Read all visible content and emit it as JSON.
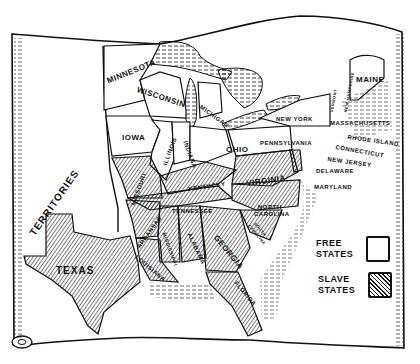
{
  "map": {
    "type": "historical-illustrated-map",
    "subject": "Free and slave states of the United States (pre-Civil War)",
    "colors": {
      "ink": "#111111",
      "paper": "#ffffff"
    },
    "labels": {
      "territories": "TERRITORIES",
      "minnesota": "MINNESOTA",
      "wisconsin": "WISCONSIN",
      "michigan": "MICHIGAN",
      "iowa": "IOWA",
      "illinois": "ILLINOIS",
      "indiana": "INDIANA",
      "ohio": "OHIO",
      "new_york": "NEW YORK",
      "pennsylvania": "PENNSYLVANIA",
      "vermont": "VERMONT",
      "new_hampshire": "NEW HAMPSHIRE",
      "maine": "MAINE",
      "massachusetts": "MASSACHUSETTS",
      "rhode_island": "RHODE ISLAND",
      "connecticut": "CONNECTICUT",
      "new_jersey": "NEW JERSEY",
      "delaware": "DELAWARE",
      "maryland": "MARYLAND",
      "missouri": "MISSOURI",
      "kentucky": "KENTUCKY",
      "virginia": "VIRGINIA",
      "tennessee": "TENNESSEE",
      "north_carolina_1": "NORTH",
      "north_carolina_2": "CAROLINA",
      "south_carolina_1": "SOUTH",
      "south_carolina_2": "CAROLINA",
      "arkansas": "ARKANSAS",
      "mississippi": "MISSISSIPPI",
      "alabama": "ALABAMA",
      "georgia": "GEORGIA",
      "louisiana": "LOUISIANA",
      "texas": "TEXAS",
      "florida": "FLORIDA"
    },
    "free_states": [
      "Minnesota",
      "Wisconsin",
      "Michigan",
      "Iowa",
      "Illinois",
      "Indiana",
      "Ohio",
      "New York",
      "Pennsylvania",
      "Vermont",
      "New Hampshire",
      "Maine",
      "Massachusetts",
      "Rhode Island",
      "Connecticut",
      "New Jersey"
    ],
    "slave_states": [
      "Missouri",
      "Kentucky",
      "Virginia",
      "Tennessee",
      "North Carolina",
      "South Carolina",
      "Arkansas",
      "Mississippi",
      "Alabama",
      "Georgia",
      "Louisiana",
      "Texas",
      "Florida",
      "Delaware",
      "Maryland"
    ]
  },
  "legend": {
    "free_label_1": "FREE",
    "free_label_2": "STATES",
    "slave_label_1": "SLAVE",
    "slave_label_2": "STATES"
  }
}
